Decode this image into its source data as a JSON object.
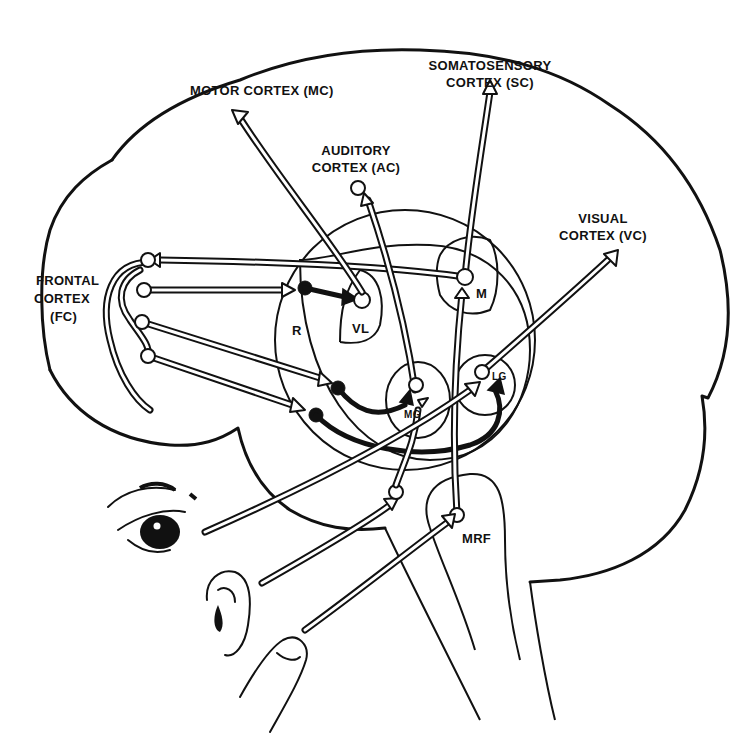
{
  "diagram": {
    "type": "neuroanatomy-schematic",
    "labels": {
      "motor_cortex": "MOTOR CORTEX (MC)",
      "somatosensory_line1": "SOMATOSENSORY",
      "somatosensory_line2": "CORTEX (SC)",
      "auditory_line1": "AUDITORY",
      "auditory_line2": "CORTEX (AC)",
      "visual_line1": "VISUAL",
      "visual_line2": "CORTEX (VC)",
      "frontal_line1": "FRONTAL",
      "frontal_line2": "CORTEX",
      "frontal_line3": "(FC)",
      "reticular": "R",
      "ventrolateral": "VL",
      "medial": "M",
      "medial_geniculate": "MG",
      "lateral_geniculate": "LG",
      "mesencephalic_reticular_formation": "MRF"
    },
    "sensory_inputs": [
      "eye",
      "ear",
      "finger"
    ],
    "colors": {
      "ink": "#111111",
      "background": "#ffffff"
    }
  }
}
